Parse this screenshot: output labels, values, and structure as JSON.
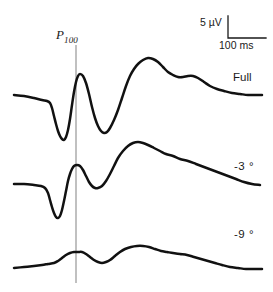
{
  "figure": {
    "type": "visual-evoked-potential-waveform-plot",
    "background_color": "#ffffff",
    "trace_color": "#111111",
    "marker_line_color": "#8c8c8c"
  },
  "annotations": {
    "p100_marker": "P",
    "p100_subscript": "100"
  },
  "scale_bar": {
    "vertical_label": "5 µV",
    "horizontal_label": "100 ms",
    "vertical_value": 5,
    "vertical_unit": "µV",
    "horizontal_value": 100,
    "horizontal_unit": "ms"
  },
  "traces": [
    {
      "label": "Full",
      "condition": "Full field"
    },
    {
      "label": "-3 °",
      "condition": "minus 3 degrees"
    },
    {
      "label": "-9 °",
      "condition": "minus 9 degrees"
    }
  ],
  "chart_data": {
    "type": "line",
    "title": "",
    "xlabel": "",
    "ylabel": "",
    "grid": false,
    "legend_position": "right-inline",
    "axes_visible": false,
    "xlim": [
      0,
      273
    ],
    "ylim": [
      0,
      292
    ],
    "annotations": [
      {
        "name": "P100 vertical marker",
        "x": 76,
        "y_top": 45,
        "y_bottom": 283,
        "color": "#8c8c8c"
      },
      {
        "name": "scale bar corner",
        "x": 228,
        "y_top": 16,
        "y_bottom": 38,
        "x_right": 266
      }
    ],
    "series": [
      {
        "name": "Full",
        "label": "Full",
        "color": "#111111",
        "points": [
          [
            14,
            95
          ],
          [
            24,
            96
          ],
          [
            34,
            98
          ],
          [
            42,
            100
          ],
          [
            47,
            101
          ],
          [
            50,
            103
          ],
          [
            52,
            108
          ],
          [
            54,
            116
          ],
          [
            56,
            124
          ],
          [
            58,
            131
          ],
          [
            60,
            136
          ],
          [
            62,
            139
          ],
          [
            64,
            140
          ],
          [
            66,
            137
          ],
          [
            68,
            130
          ],
          [
            70,
            119
          ],
          [
            72,
            105
          ],
          [
            74,
            92
          ],
          [
            76,
            82
          ],
          [
            78,
            76
          ],
          [
            80,
            74
          ],
          [
            83,
            76
          ],
          [
            86,
            83
          ],
          [
            89,
            94
          ],
          [
            92,
            107
          ],
          [
            95,
            118
          ],
          [
            98,
            126
          ],
          [
            101,
            131
          ],
          [
            104,
            133
          ],
          [
            107,
            132
          ],
          [
            110,
            128
          ],
          [
            114,
            120
          ],
          [
            118,
            110
          ],
          [
            122,
            98
          ],
          [
            126,
            86
          ],
          [
            130,
            76
          ],
          [
            134,
            69
          ],
          [
            138,
            64
          ],
          [
            143,
            60
          ],
          [
            148,
            58
          ],
          [
            153,
            59
          ],
          [
            158,
            62
          ],
          [
            163,
            67
          ],
          [
            168,
            72
          ],
          [
            173,
            75
          ],
          [
            178,
            77
          ],
          [
            183,
            77
          ],
          [
            188,
            76
          ],
          [
            193,
            76
          ],
          [
            198,
            78
          ],
          [
            204,
            82
          ],
          [
            210,
            86
          ],
          [
            217,
            89
          ],
          [
            224,
            91
          ],
          [
            232,
            93
          ],
          [
            240,
            94
          ],
          [
            248,
            95
          ],
          [
            256,
            95
          ],
          [
            262,
            95
          ]
        ]
      },
      {
        "name": "-3 degrees",
        "label": "-3 °",
        "color": "#111111",
        "points": [
          [
            14,
            184
          ],
          [
            24,
            184
          ],
          [
            34,
            185
          ],
          [
            41,
            186
          ],
          [
            45,
            188
          ],
          [
            48,
            193
          ],
          [
            50,
            200
          ],
          [
            52,
            207
          ],
          [
            54,
            213
          ],
          [
            56,
            217
          ],
          [
            58,
            218
          ],
          [
            60,
            216
          ],
          [
            62,
            210
          ],
          [
            64,
            201
          ],
          [
            66,
            191
          ],
          [
            68,
            181
          ],
          [
            70,
            174
          ],
          [
            72,
            169
          ],
          [
            74,
            166
          ],
          [
            77,
            165
          ],
          [
            80,
            166
          ],
          [
            83,
            170
          ],
          [
            86,
            176
          ],
          [
            89,
            182
          ],
          [
            92,
            186
          ],
          [
            95,
            188
          ],
          [
            98,
            188
          ],
          [
            102,
            186
          ],
          [
            106,
            181
          ],
          [
            110,
            174
          ],
          [
            114,
            166
          ],
          [
            118,
            158
          ],
          [
            123,
            151
          ],
          [
            128,
            146
          ],
          [
            133,
            143
          ],
          [
            138,
            142
          ],
          [
            143,
            143
          ],
          [
            148,
            145
          ],
          [
            154,
            148
          ],
          [
            160,
            151
          ],
          [
            166,
            154
          ],
          [
            173,
            156
          ],
          [
            180,
            159
          ],
          [
            188,
            161
          ],
          [
            196,
            164
          ],
          [
            204,
            167
          ],
          [
            212,
            170
          ],
          [
            220,
            173
          ],
          [
            228,
            176
          ],
          [
            236,
            179
          ],
          [
            244,
            182
          ],
          [
            252,
            184
          ],
          [
            260,
            185
          ]
        ]
      },
      {
        "name": "-9 degrees",
        "label": "-9 °",
        "color": "#111111",
        "points": [
          [
            14,
            268
          ],
          [
            24,
            267
          ],
          [
            34,
            266
          ],
          [
            42,
            265
          ],
          [
            48,
            264
          ],
          [
            54,
            263
          ],
          [
            58,
            261
          ],
          [
            62,
            258
          ],
          [
            66,
            255
          ],
          [
            70,
            253
          ],
          [
            74,
            252
          ],
          [
            78,
            252
          ],
          [
            82,
            252
          ],
          [
            86,
            254
          ],
          [
            90,
            257
          ],
          [
            94,
            260
          ],
          [
            98,
            262
          ],
          [
            102,
            263
          ],
          [
            106,
            262
          ],
          [
            110,
            260
          ],
          [
            115,
            256
          ],
          [
            120,
            252
          ],
          [
            125,
            249
          ],
          [
            131,
            247
          ],
          [
            137,
            246
          ],
          [
            143,
            246
          ],
          [
            149,
            247
          ],
          [
            155,
            249
          ],
          [
            161,
            251
          ],
          [
            167,
            252
          ],
          [
            173,
            253
          ],
          [
            180,
            254
          ],
          [
            187,
            255
          ],
          [
            194,
            257
          ],
          [
            201,
            259
          ],
          [
            208,
            261
          ],
          [
            215,
            263
          ],
          [
            222,
            265
          ],
          [
            230,
            267
          ],
          [
            238,
            268
          ],
          [
            246,
            269
          ],
          [
            254,
            269
          ],
          [
            262,
            269
          ]
        ]
      }
    ]
  }
}
